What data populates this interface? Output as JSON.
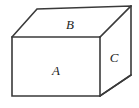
{
  "figure": {
    "background_color": "#ffffff",
    "stroke_color": "#3a3a3a",
    "fill_color": "#ffffff",
    "label_color": "#1d1d1d",
    "width": 139,
    "height": 108,
    "labels": {
      "front_face": "A",
      "top_face": "B",
      "right_face": "C"
    },
    "label_positions": {
      "front_face": {
        "x": 56,
        "y": 70
      },
      "top_face": {
        "x": 70,
        "y": 24
      },
      "right_face": {
        "x": 114,
        "y": 57
      }
    },
    "vertices": {
      "front_top_left": {
        "x": 12,
        "y": 37
      },
      "front_top_right": {
        "x": 100,
        "y": 37
      },
      "front_bottom_right": {
        "x": 100,
        "y": 96
      },
      "front_bottom_left": {
        "x": 12,
        "y": 96
      },
      "back_top_left": {
        "x": 37,
        "y": 9
      },
      "back_top_right": {
        "x": 131,
        "y": 6
      },
      "back_bottom_right": {
        "x": 131,
        "y": 75
      }
    },
    "faces": [
      {
        "name": "front",
        "label": "A",
        "points": "12,37 100,37 100,96 12,96"
      },
      {
        "name": "top",
        "label": "B",
        "points": "12,37 37,9 131,6 100,37"
      },
      {
        "name": "right",
        "label": "C",
        "points": "100,37 131,6 131,75 100,96"
      }
    ]
  }
}
